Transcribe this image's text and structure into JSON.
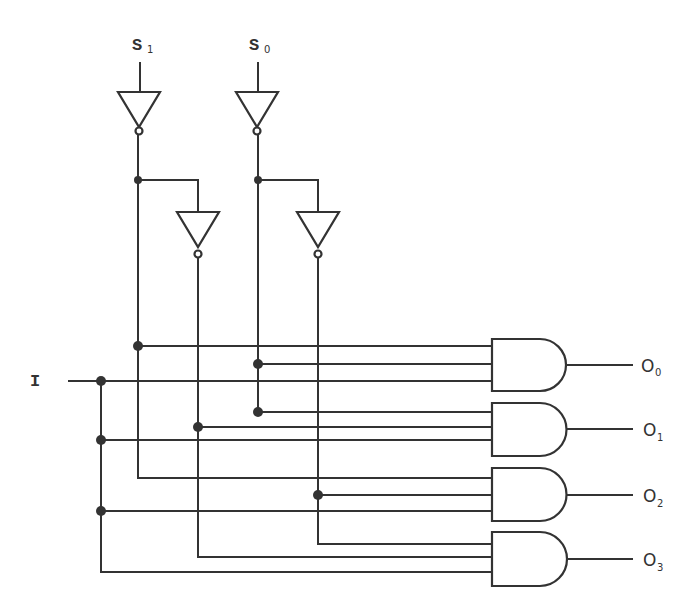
{
  "diagram": {
    "colors": {
      "stroke": "#333333",
      "background": "#ffffff"
    },
    "inputs": {
      "s1": {
        "label": "S",
        "sub": "1"
      },
      "s0": {
        "label": "S",
        "sub": "0"
      },
      "i": {
        "label": "I"
      }
    },
    "outputs": [
      {
        "label": "O",
        "sub": "0"
      },
      {
        "label": "O",
        "sub": "1"
      },
      {
        "label": "O",
        "sub": "2"
      },
      {
        "label": "O",
        "sub": "3"
      }
    ],
    "components": {
      "not_gates": 4,
      "and_gates": 4,
      "and_gate_inputs": 3
    }
  }
}
